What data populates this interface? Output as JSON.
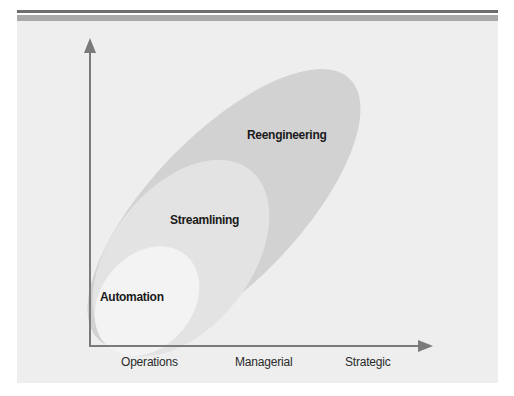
{
  "figure": {
    "colors": {
      "top_rule_dark": "#6e6e6e",
      "top_rule_light": "#a9a9a9",
      "panel_background": "#eeeeee",
      "reengineering_fill": "#d2d2d2",
      "streamlining_fill": "#e3e3e3",
      "automation_fill": "#f3f3f3",
      "axis_color": "#7a7a7a"
    },
    "zones": [
      {
        "label": "Reengineering"
      },
      {
        "label": "Streamlining"
      },
      {
        "label": "Automation"
      }
    ],
    "x_axis": {
      "labels": [
        "Operations",
        "Managerial",
        "Strategic"
      ]
    }
  }
}
